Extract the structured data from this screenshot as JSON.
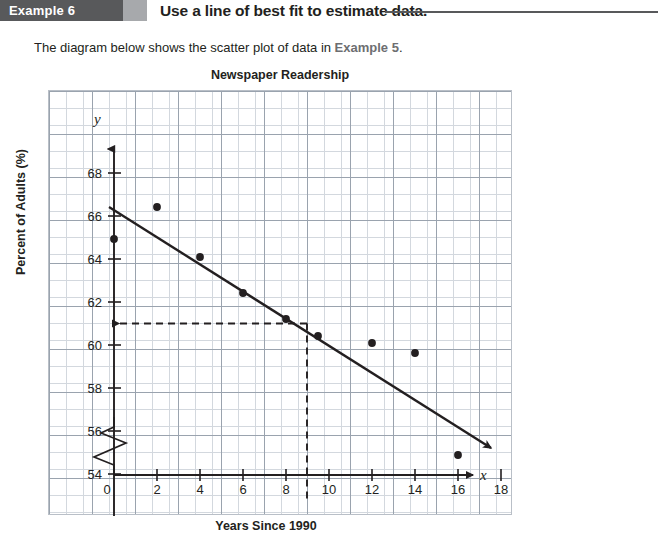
{
  "header": {
    "example_tag": "Example 6",
    "title": "Use a line of best fit to estimate data."
  },
  "intro": {
    "text_before": "The diagram below shows the scatter plot of data in ",
    "reference": "Example 5",
    "text_after": "."
  },
  "axis_labels": {
    "y": "Percent of Adults (%)",
    "x": "Years Since 1990",
    "x_symbol": "x",
    "y_symbol": "y"
  },
  "chart_data": {
    "type": "scatter",
    "title": "Newspaper Readership",
    "xlabel": "Years Since 1990",
    "ylabel": "Percent of Adults (%)",
    "xlim": [
      0,
      19.5
    ],
    "ylim": [
      53,
      69.5
    ],
    "y_axis_break": true,
    "grid": true,
    "xticks": [
      0,
      2,
      4,
      6,
      8,
      10,
      12,
      14,
      16,
      18
    ],
    "xtick_labels": [
      "0",
      "2",
      "4",
      "6",
      "8",
      "10",
      "12",
      "14",
      "16",
      "18"
    ],
    "yticks": [
      54,
      56,
      58,
      60,
      62,
      64,
      66,
      68
    ],
    "ytick_labels": [
      "54",
      "56",
      "58",
      "60",
      "62",
      "64",
      "66",
      "68"
    ],
    "points": [
      {
        "x": 0,
        "y": 64.9
      },
      {
        "x": 2,
        "y": 66.4
      },
      {
        "x": 4,
        "y": 64.1
      },
      {
        "x": 6,
        "y": 62.4
      },
      {
        "x": 8,
        "y": 61.2
      },
      {
        "x": 9.5,
        "y": 60.4
      },
      {
        "x": 12,
        "y": 60.1
      },
      {
        "x": 14,
        "y": 59.6
      },
      {
        "x": 16,
        "y": 54.9
      }
    ],
    "line_of_best_fit": {
      "label": "line of best fit",
      "x1": 0,
      "y1": 66.6,
      "x2": 19.1,
      "y2": 55.3,
      "arrow_end": true
    },
    "estimate_guides": [
      {
        "type": "horizontal",
        "y": 61.0,
        "from_x": 0,
        "to_x": 9.0,
        "arrow": "left"
      },
      {
        "type": "vertical",
        "x": 9.0,
        "from_y": 61.0,
        "to_y": 51.5,
        "arrow": "none"
      }
    ]
  }
}
